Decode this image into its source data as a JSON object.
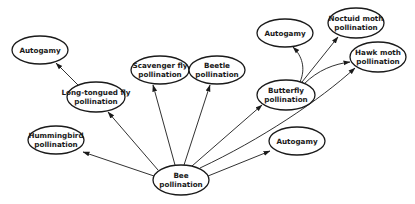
{
  "diagram": {
    "type": "directed-graph",
    "nodes": [
      {
        "id": "bee",
        "lines": [
          "Bee",
          "pollination"
        ],
        "cx": 181,
        "cy": 180,
        "rx": 28,
        "ry": 15
      },
      {
        "id": "hummingbird",
        "lines": [
          "Hummingbird",
          "pollination"
        ],
        "cx": 56,
        "cy": 140,
        "rx": 28,
        "ry": 14
      },
      {
        "id": "long-tongued-fly",
        "lines": [
          "Long-tongued fly",
          "pollination"
        ],
        "cx": 96,
        "cy": 97,
        "rx": 29,
        "ry": 15
      },
      {
        "id": "autogamy-1",
        "lines": [
          "Autogamy"
        ],
        "cx": 40,
        "cy": 50,
        "rx": 28,
        "ry": 14
      },
      {
        "id": "scavenger-fly",
        "lines": [
          "Scavenger fly",
          "pollination"
        ],
        "cx": 160,
        "cy": 70,
        "rx": 29,
        "ry": 14
      },
      {
        "id": "beetle",
        "lines": [
          "Beetle",
          "pollination"
        ],
        "cx": 217,
        "cy": 70,
        "rx": 28,
        "ry": 14
      },
      {
        "id": "butterfly",
        "lines": [
          "Butterfly",
          "pollination"
        ],
        "cx": 286,
        "cy": 95,
        "rx": 29,
        "ry": 15
      },
      {
        "id": "autogamy-2",
        "lines": [
          "Autogamy"
        ],
        "cx": 285,
        "cy": 33,
        "rx": 28,
        "ry": 14
      },
      {
        "id": "noctuid-moth",
        "lines": [
          "Noctuid moth",
          "pollination"
        ],
        "cx": 356,
        "cy": 23,
        "rx": 28,
        "ry": 15
      },
      {
        "id": "hawk-moth",
        "lines": [
          "Hawk moth",
          "pollination"
        ],
        "cx": 378,
        "cy": 57,
        "rx": 28,
        "ry": 15
      },
      {
        "id": "autogamy-3",
        "lines": [
          "Autogamy"
        ],
        "cx": 297,
        "cy": 141,
        "rx": 28,
        "ry": 14
      }
    ],
    "edges": [
      {
        "from": "bee",
        "to": "hummingbird",
        "path": "M154,176 L83,152"
      },
      {
        "from": "bee",
        "to": "long-tongued-fly",
        "path": "M158,170 L108,112"
      },
      {
        "from": "long-tongued-fly",
        "to": "autogamy-1",
        "path": "M78,85 L56,63"
      },
      {
        "from": "bee",
        "to": "scavenger-fly",
        "path": "M175,165 L153,85"
      },
      {
        "from": "bee",
        "to": "beetle",
        "path": "M184,165 L210,85"
      },
      {
        "from": "bee",
        "to": "butterfly",
        "path": "M192,166 L262,105"
      },
      {
        "from": "bee",
        "to": "hawk-moth",
        "path": "M200,168 C260,140 320,100 355,68"
      },
      {
        "from": "bee",
        "to": "autogamy-3",
        "path": "M208,176 L270,151"
      },
      {
        "from": "butterfly",
        "to": "autogamy-2",
        "path": "M300,82 C306,68 302,56 293,47"
      },
      {
        "from": "butterfly",
        "to": "noctuid-moth",
        "path": "M302,82 L338,37"
      },
      {
        "from": "butterfly",
        "to": "hawk-moth",
        "path": "M304,84 C318,70 334,64 350,62"
      }
    ]
  }
}
